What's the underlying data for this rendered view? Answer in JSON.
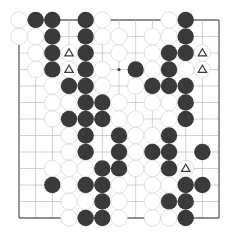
{
  "board": {
    "size": 13,
    "origin": {
      "x": 19,
      "y": 20
    },
    "spacing": {
      "x": 16.67,
      "y": 16.5
    },
    "stone_radius": 8.2,
    "colors": {
      "black": "#3a3a3a",
      "white": "#ffffff",
      "grid": "#bdbdbd",
      "edge": "#6a6a6a"
    },
    "edges": {
      "top": true,
      "left": true,
      "right": true,
      "bottom": true
    },
    "star_points": [
      [
        6,
        3
      ]
    ],
    "rows": [
      "WBB.BW...WB..",
      "WWB.BWW.WWB..",
      ".WBTB.W.WBBT.",
      ".WBTBW.BWBWT.",
      "..WBBW.WBBB..",
      "..WWBBW.WWB..",
      "..WBBBWW.WB..",
      "...WB.BWWB...",
      "...WB.BWBB.B.",
      "..WWWBBWWBT..",
      "..BWBBW.WWBB.",
      "...WWBW.WBB..",
      "...WBBW.WWB.."
    ],
    "legend": {
      "B": "black stone",
      "W": "white stone",
      "T": "triangle-marked empty point",
      ".": "empty"
    },
    "triangle_markers": [
      [
        3,
        2
      ],
      [
        3,
        3
      ],
      [
        11,
        2
      ],
      [
        11,
        3
      ],
      [
        10,
        9
      ]
    ]
  }
}
